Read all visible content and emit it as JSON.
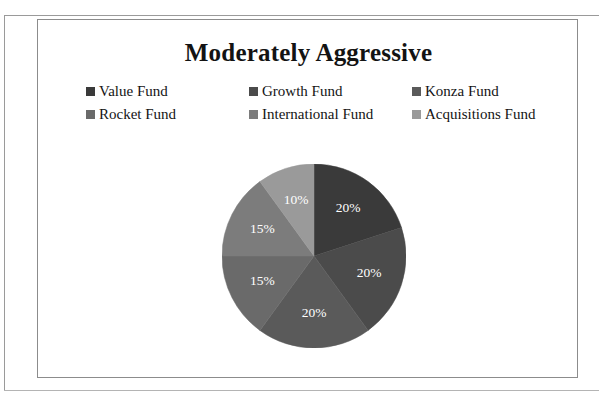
{
  "chart_data": {
    "type": "pie",
    "title": "Moderately Aggressive",
    "categories": [
      "Value Fund",
      "Growth Fund",
      "Konza Fund",
      "Rocket Fund",
      "International Fund",
      "Acquisitions Fund"
    ],
    "values": [
      20,
      20,
      20,
      15,
      15,
      10
    ],
    "value_labels": [
      "20%",
      "20%",
      "20%",
      "15%",
      "15%",
      "10%"
    ],
    "colors": [
      "#3a3a3a",
      "#4b4b4b",
      "#5a5a5a",
      "#6a6a6a",
      "#7c7c7c",
      "#9a9a9a"
    ],
    "units": "percent",
    "total": 100,
    "start_angle_deg": 0,
    "direction": "clockwise",
    "legend_position": "top",
    "legend_columns": 3,
    "label_color": "#ffffff",
    "xlabel": "",
    "ylabel": ""
  },
  "chart": {
    "title": "Moderately Aggressive",
    "legend": {
      "rows": [
        [
          {
            "label": "Value Fund",
            "color": "#3a3a3a"
          },
          {
            "label": "Growth Fund",
            "color": "#4b4b4b"
          },
          {
            "label": "Konza Fund",
            "color": "#5a5a5a"
          }
        ],
        [
          {
            "label": "Rocket Fund",
            "color": "#6a6a6a"
          },
          {
            "label": "International Fund",
            "color": "#7c7c7c"
          },
          {
            "label": "Acquisitions Fund",
            "color": "#9a9a9a"
          }
        ]
      ]
    },
    "slices": [
      {
        "name": "Value Fund",
        "label": "20%",
        "value": 20,
        "color": "#3a3a3a"
      },
      {
        "name": "Growth Fund",
        "label": "20%",
        "value": 20,
        "color": "#4b4b4b"
      },
      {
        "name": "Konza Fund",
        "label": "20%",
        "value": 20,
        "color": "#5a5a5a"
      },
      {
        "name": "Rocket Fund",
        "label": "15%",
        "value": 15,
        "color": "#6a6a6a"
      },
      {
        "name": "International Fund",
        "label": "15%",
        "value": 15,
        "color": "#7c7c7c"
      },
      {
        "name": "Acquisitions Fund",
        "label": "10%",
        "value": 10,
        "color": "#9a9a9a"
      }
    ]
  }
}
